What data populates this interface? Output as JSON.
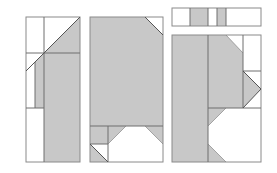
{
  "canvas": {
    "width": 277,
    "height": 173,
    "background": "#ffffff"
  },
  "colors": {
    "fill": "#c8c8c8",
    "stroke": "#6e6e6e",
    "light_stroke": "#9a9a9a",
    "white": "#ffffff"
  },
  "panels": [
    {
      "name": "panel-left",
      "x": 26,
      "y": 17,
      "w": 54,
      "h": 145
    },
    {
      "name": "panel-middle",
      "x": 90,
      "y": 17,
      "w": 73,
      "h": 145
    },
    {
      "name": "panel-right",
      "x": 172,
      "y": 35,
      "w": 89,
      "h": 127
    },
    {
      "name": "panel-right-top-strip",
      "x": 172,
      "y": 8,
      "w": 89,
      "h": 18
    }
  ]
}
